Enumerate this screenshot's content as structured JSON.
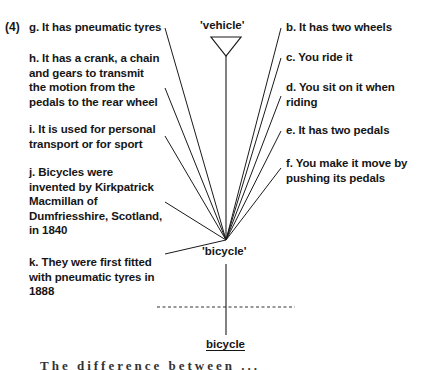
{
  "figure": {
    "number": "(4)",
    "top_node": "'vehicle'",
    "center_node": "'bicycle'",
    "bottom_word": "bicycle",
    "left_features": [
      {
        "id": "g",
        "lines": [
          "g. It has pneumatic tyres"
        ]
      },
      {
        "id": "h",
        "lines": [
          "h. It has a crank, a chain",
          "and gears to transmit",
          "the motion from the",
          "pedals to the rear wheel"
        ]
      },
      {
        "id": "i",
        "lines": [
          "i. It is used for personal",
          "transport or for sport"
        ]
      },
      {
        "id": "j",
        "lines": [
          "j. Bicycles were",
          "invented by Kirkpatrick",
          "Macmillan of",
          "Dumfriesshire, Scotland,",
          "in 1840"
        ]
      },
      {
        "id": "k",
        "lines": [
          "k. They were first fitted",
          "with pneumatic tyres in",
          "1888"
        ]
      }
    ],
    "right_features": [
      {
        "id": "b",
        "lines": [
          "b. It has two wheels"
        ]
      },
      {
        "id": "c",
        "lines": [
          "c. You ride it"
        ]
      },
      {
        "id": "d",
        "lines": [
          "d. You sit on it when",
          "riding"
        ]
      },
      {
        "id": "e",
        "lines": [
          "e. It has two pedals"
        ]
      },
      {
        "id": "f",
        "lines": [
          "f. You make it move by",
          "pushing its pedals"
        ]
      }
    ],
    "cut_off_text": "The difference between ..."
  }
}
